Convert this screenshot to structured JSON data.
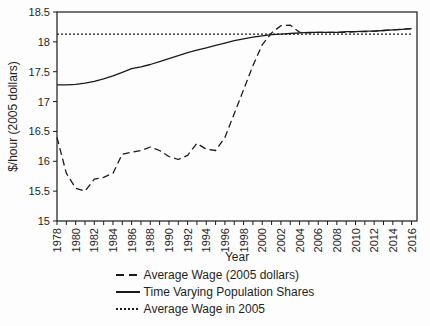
{
  "chart_data": {
    "type": "line",
    "title": "",
    "xlabel": "Year",
    "ylabel": "$/hour (2005 dollars)",
    "x": [
      1978,
      1979,
      1980,
      1981,
      1982,
      1983,
      1984,
      1985,
      1986,
      1987,
      1988,
      1989,
      1990,
      1991,
      1992,
      1993,
      1994,
      1995,
      1996,
      1997,
      1998,
      1999,
      2000,
      2001,
      2002,
      2003,
      2004,
      2005,
      2006,
      2007,
      2008,
      2009,
      2010,
      2011,
      2012,
      2013,
      2014,
      2015,
      2016
    ],
    "xtick_labels": [
      1978,
      1980,
      1982,
      1984,
      1986,
      1988,
      1990,
      1992,
      1994,
      1996,
      1998,
      2000,
      2002,
      2004,
      2006,
      2008,
      2010,
      2012,
      2014,
      2016
    ],
    "ytick_labels": [
      "15",
      "15.5",
      "16",
      "16.5",
      "17",
      "17.5",
      "18",
      "18.5"
    ],
    "yticks": [
      15,
      15.5,
      16,
      16.5,
      17,
      17.5,
      18,
      18.5
    ],
    "ylim": [
      15,
      18.5
    ],
    "grid": false,
    "legend_position": "bottom",
    "line_color": "#1a1a1a",
    "series": [
      {
        "name": "Average Wage (2005 dollars)",
        "dash": "dashed",
        "values": [
          16.4,
          15.8,
          15.55,
          15.5,
          15.7,
          15.73,
          15.8,
          16.12,
          16.15,
          16.18,
          16.24,
          16.18,
          16.08,
          16.03,
          16.1,
          16.3,
          16.2,
          16.18,
          16.4,
          16.8,
          17.2,
          17.6,
          17.95,
          18.15,
          18.27,
          18.28,
          18.16,
          18.15,
          18.16,
          18.16,
          18.16,
          18.16,
          18.17,
          18.17,
          18.18,
          18.19,
          18.2,
          18.21,
          18.22
        ]
      },
      {
        "name": "Time Varying Population Shares",
        "dash": "solid",
        "values": [
          17.28,
          17.28,
          17.29,
          17.31,
          17.34,
          17.38,
          17.43,
          17.49,
          17.55,
          17.58,
          17.62,
          17.67,
          17.72,
          17.77,
          17.82,
          17.86,
          17.9,
          17.94,
          17.98,
          18.02,
          18.05,
          18.08,
          18.1,
          18.12,
          18.13,
          18.14,
          18.15,
          18.16,
          18.16,
          18.16,
          18.16,
          18.17,
          18.17,
          18.18,
          18.18,
          18.19,
          18.2,
          18.21,
          18.22
        ]
      },
      {
        "name": "Average Wage in 2005",
        "dash": "dotted",
        "constant": 18.13
      }
    ]
  }
}
